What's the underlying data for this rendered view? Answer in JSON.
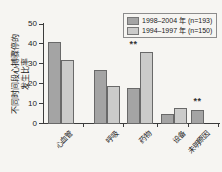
{
  "chart_data": {
    "type": "bar",
    "title": "",
    "categories": [
      "心血管",
      "呼吸",
      "药物",
      "设备",
      "未明原因"
    ],
    "series": [
      {
        "name": "1998–2004 年 (n=193)",
        "color": "#a4a4a4",
        "values": [
          41,
          27,
          18,
          5,
          7
        ]
      },
      {
        "name": "1994–1997 年 (n=150)",
        "color": "#cbcbca",
        "values": [
          32,
          19,
          36,
          8,
          null
        ]
      }
    ],
    "xlabel": "",
    "ylabel": "不同时间段心搏骤停的发生比率",
    "ylabel_lines": [
      "不同时间段心搏骤停的",
      "发生比率"
    ],
    "ylim": [
      0,
      50
    ],
    "yticks": [
      0,
      10,
      20,
      30,
      40,
      50
    ],
    "grid": false,
    "legend_position": "top-right",
    "annotations": [
      {
        "text": "**",
        "category": "药物",
        "series_index": 0,
        "y": 38
      },
      {
        "text": "**",
        "category": "未明原因",
        "series_index": 0,
        "y": 9.5
      }
    ]
  }
}
